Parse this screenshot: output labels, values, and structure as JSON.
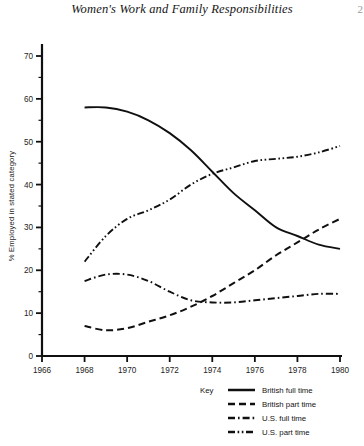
{
  "page": {
    "running_head": "Women's Work and Family Responsibilities",
    "page_number": "2"
  },
  "legend": {
    "key_label": "Key",
    "entries": [
      {
        "label": "British full time",
        "style": "solid"
      },
      {
        "label": "British part time",
        "style": "dashed"
      },
      {
        "label": "U.S. full time",
        "style": "dash-dot"
      },
      {
        "label": "U.S. part time",
        "style": "dash-dot-dot"
      }
    ]
  },
  "chart_data": {
    "type": "line",
    "title": "Women's Work and Family Responsibilities",
    "xlabel": "",
    "ylabel": "% Employed in stated category",
    "x": [
      1968,
      1970,
      1972,
      1974,
      1976,
      1978,
      1980
    ],
    "xlim": [
      1966,
      1980
    ],
    "ylim": [
      0,
      70
    ],
    "xticks": [
      1966,
      1968,
      1970,
      1972,
      1974,
      1976,
      1978,
      1980
    ],
    "yticks": [
      0,
      10,
      20,
      30,
      40,
      50,
      60,
      70
    ],
    "yminorticks": [
      5,
      15,
      25,
      35,
      45,
      55,
      65
    ],
    "grid": false,
    "legend_position": "bottom-right",
    "series": [
      {
        "name": "British full time",
        "style": "solid",
        "x": [
          1968,
          1969,
          1970,
          1971,
          1972,
          1973,
          1974,
          1975,
          1976,
          1977,
          1978,
          1979,
          1980
        ],
        "values": [
          58,
          58,
          57,
          55,
          52,
          48,
          43,
          38,
          34,
          30,
          28,
          26,
          25
        ]
      },
      {
        "name": "British part time",
        "style": "dashed",
        "x": [
          1968,
          1969,
          1970,
          1971,
          1972,
          1973,
          1974,
          1975,
          1976,
          1977,
          1978,
          1979,
          1980
        ],
        "values": [
          7,
          6,
          6.5,
          8,
          9.5,
          11.5,
          14,
          17,
          20,
          23.5,
          26.5,
          29.5,
          32
        ]
      },
      {
        "name": "U.S. full time",
        "style": "dash-dot",
        "x": [
          1968,
          1969,
          1970,
          1971,
          1972,
          1973,
          1974,
          1975,
          1976,
          1977,
          1978,
          1979,
          1980
        ],
        "values": [
          17.5,
          19,
          19,
          17.5,
          15,
          13,
          12.5,
          12.5,
          13,
          13.5,
          14,
          14.5,
          14.5
        ]
      },
      {
        "name": "U.S. part time",
        "style": "dash-dot-dot",
        "x": [
          1968,
          1969,
          1970,
          1971,
          1972,
          1973,
          1974,
          1975,
          1976,
          1977,
          1978,
          1979,
          1980
        ],
        "values": [
          22,
          28,
          32,
          34,
          36.5,
          40,
          42.5,
          44,
          45.5,
          46,
          46.5,
          47.5,
          49
        ]
      }
    ]
  }
}
